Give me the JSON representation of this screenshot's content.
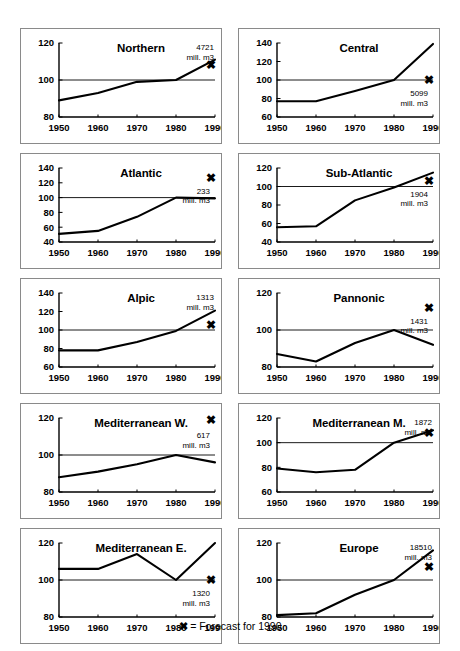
{
  "legend": {
    "marker": "✖",
    "equals": "=",
    "text": "Forecast for 1990"
  },
  "axis": {
    "unit_line": "mill. m3",
    "x_ticks": [
      "1950",
      "1960",
      "1970",
      "1980",
      "1990"
    ]
  },
  "chart_data": [
    {
      "type": "line",
      "title": "Northern",
      "x": [
        "1950",
        "1960",
        "1970",
        "1980",
        "1990"
      ],
      "values": [
        89,
        93,
        99,
        100,
        111
      ],
      "forecast_1990": 108,
      "total_value": "4721",
      "total_unit": "mill. m3",
      "reference_level": 100,
      "ylim": [
        80,
        120
      ],
      "yticks": [
        80,
        100,
        120
      ],
      "xlabel": "",
      "ylabel": "",
      "annotation_inside": false
    },
    {
      "type": "line",
      "title": "Central",
      "x": [
        "1950",
        "1960",
        "1970",
        "1980",
        "1990"
      ],
      "values": [
        77,
        77,
        88,
        100,
        139
      ],
      "forecast_1990": 100,
      "total_value": "5099",
      "total_unit": "mill. m3",
      "reference_level": 100,
      "ylim": [
        60,
        140
      ],
      "yticks": [
        60,
        80,
        100,
        120,
        140
      ],
      "xlabel": "",
      "ylabel": "",
      "annotation_inside": true
    },
    {
      "type": "line",
      "title": "Atlantic",
      "x": [
        "1950",
        "1960",
        "1970",
        "1980",
        "1990"
      ],
      "values": [
        51,
        55,
        74,
        100,
        99
      ],
      "forecast_1990": 127,
      "total_value": "233",
      "total_unit": "mill. m3",
      "reference_level": 100,
      "ylim": [
        40,
        140
      ],
      "yticks": [
        40,
        60,
        80,
        100,
        120,
        140
      ],
      "xlabel": "",
      "ylabel": "",
      "annotation_inside": true
    },
    {
      "type": "line",
      "title": "Sub-Atlantic",
      "x": [
        "1950",
        "1960",
        "1970",
        "1980",
        "1990"
      ],
      "values": [
        56,
        57,
        85,
        99,
        115
      ],
      "forecast_1990": 106,
      "total_value": "1904",
      "total_unit": "mill. m3",
      "reference_level": 100,
      "ylim": [
        40,
        120
      ],
      "yticks": [
        40,
        60,
        80,
        100,
        120
      ],
      "xlabel": "",
      "ylabel": "",
      "annotation_inside": true
    },
    {
      "type": "line",
      "title": "Alpic",
      "x": [
        "1950",
        "1960",
        "1970",
        "1980",
        "1990"
      ],
      "values": [
        78,
        78,
        87,
        99,
        121
      ],
      "forecast_1990": 105,
      "total_value": "1313",
      "total_unit": "mill. m3",
      "reference_level": 100,
      "ylim": [
        60,
        140
      ],
      "yticks": [
        60,
        80,
        100,
        120,
        140
      ],
      "xlabel": "",
      "ylabel": "",
      "annotation_inside": false
    },
    {
      "type": "line",
      "title": "Pannonic",
      "x": [
        "1950",
        "1960",
        "1970",
        "1980",
        "1990"
      ],
      "values": [
        87,
        83,
        93,
        100,
        92
      ],
      "forecast_1990": 112,
      "total_value": "1431",
      "total_unit": "mill. m3",
      "reference_level": 100,
      "ylim": [
        80,
        120
      ],
      "yticks": [
        80,
        100,
        120
      ],
      "xlabel": "",
      "ylabel": "",
      "annotation_inside": true
    },
    {
      "type": "line",
      "title": "Mediterranean W.",
      "x": [
        "1950",
        "1960",
        "1970",
        "1980",
        "1990"
      ],
      "values": [
        88,
        91,
        95,
        100,
        96
      ],
      "forecast_1990": 119,
      "total_value": "617",
      "total_unit": "mill. m3",
      "reference_level": 100,
      "ylim": [
        80,
        120
      ],
      "yticks": [
        80,
        100,
        120
      ],
      "xlabel": "",
      "ylabel": "",
      "annotation_inside": true
    },
    {
      "type": "line",
      "title": "Mediterranean M.",
      "x": [
        "1950",
        "1960",
        "1970",
        "1980",
        "1990"
      ],
      "values": [
        79,
        76,
        78,
        100,
        110
      ],
      "forecast_1990": 108,
      "total_value": "1872",
      "total_unit": "mill. m3",
      "reference_level": 100,
      "ylim": [
        60,
        120
      ],
      "yticks": [
        60,
        80,
        100,
        120
      ],
      "xlabel": "",
      "ylabel": "",
      "annotation_inside": false
    },
    {
      "type": "line",
      "title": "Mediterranean E.",
      "x": [
        "1950",
        "1960",
        "1970",
        "1980",
        "1990"
      ],
      "values": [
        106,
        106,
        114,
        100,
        120
      ],
      "forecast_1990": 100,
      "total_value": "1320",
      "total_unit": "mill. m3",
      "reference_level": 100,
      "ylim": [
        80,
        120
      ],
      "yticks": [
        80,
        100,
        120
      ],
      "xlabel": "",
      "ylabel": "",
      "annotation_inside": true
    },
    {
      "type": "line",
      "title": "Europe",
      "x": [
        "1950",
        "1960",
        "1970",
        "1980",
        "1990"
      ],
      "values": [
        81,
        82,
        92,
        100,
        116
      ],
      "forecast_1990": 107,
      "total_value": "18510",
      "total_unit": "mill. m3",
      "reference_level": 100,
      "ylim": [
        80,
        120
      ],
      "yticks": [
        80,
        100,
        120
      ],
      "xlabel": "",
      "ylabel": "",
      "annotation_inside": false
    }
  ]
}
